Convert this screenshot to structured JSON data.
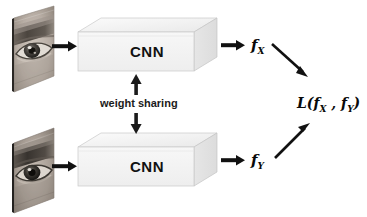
{
  "diagram": {
    "background_color": "#ffffff",
    "ink_color": "#111111",
    "box_fill_color": "#f2f2f2",
    "box_top_color": "#ededed",
    "box_side_color": "#e2e2e2",
    "box_edge_color": "#bdbdbd"
  },
  "branches": {
    "top": {
      "image_label": "eye-image-x",
      "processor_label": "CNN",
      "feature_symbol": "f",
      "feature_subscript": "X"
    },
    "bottom": {
      "image_label": "eye-image-y",
      "processor_label": "CNN",
      "feature_symbol": "f",
      "feature_subscript": "Y"
    }
  },
  "weight_sharing": {
    "label": "weight sharing",
    "up_arrow": "arrow-up",
    "down_arrow": "arrow-down"
  },
  "loss": {
    "function_name": "L",
    "open_paren": "(",
    "arg1_symbol": "f",
    "arg1_subscript": "X",
    "separator": " , ",
    "arg2_symbol": "f",
    "arg2_subscript": "Y",
    "close_paren": ")"
  },
  "arrows": {
    "image_to_cnn_top": "arrow-right",
    "image_to_cnn_bottom": "arrow-right",
    "cnn_to_feature_top": "arrow-right",
    "cnn_to_feature_bottom": "arrow-right",
    "feature_top_to_loss": "arrow-down-right",
    "feature_bottom_to_loss": "arrow-up-right"
  }
}
